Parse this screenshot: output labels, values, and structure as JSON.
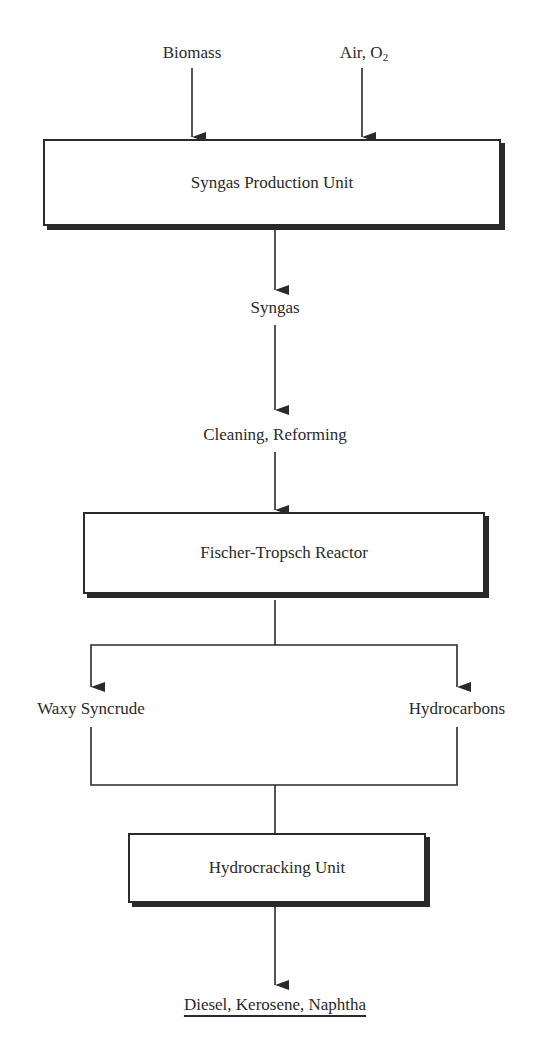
{
  "inputs": {
    "biomass": "Biomass",
    "air": "Air, O",
    "air_subscript": "2"
  },
  "units": {
    "syngas_production": "Syngas Production Unit",
    "fischer_tropsch": "Fischer-Tropsch Reactor",
    "hydrocracking": "Hydrocracking Unit"
  },
  "streams": {
    "syngas": "Syngas",
    "cleaning": "Cleaning, Reforming",
    "waxy": "Waxy Syncrude",
    "hydrocarbons": "Hydrocarbons"
  },
  "products": {
    "final": "Diesel, Kerosene, Naphtha"
  },
  "colors": {
    "line": "#2a2a2a",
    "background": "#ffffff"
  }
}
